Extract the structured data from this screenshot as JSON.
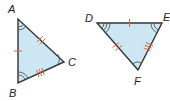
{
  "figure": {
    "colors": {
      "fill": "#cce7f3",
      "edge": "#333333",
      "tick": "#e0603a",
      "arc": "#555555"
    },
    "triangles": [
      {
        "name": "triangle-abc",
        "vertices": [
          {
            "label": "A",
            "x": 18,
            "y": 19
          },
          {
            "label": "B",
            "x": 18,
            "y": 83
          },
          {
            "label": "C",
            "x": 64,
            "y": 62
          }
        ],
        "side_marks": {
          "AB": 1,
          "AC": 2,
          "BC": 3
        },
        "angle_arcs": {
          "A": 2,
          "B": 2,
          "C": 1
        }
      },
      {
        "name": "triangle-def",
        "vertices": [
          {
            "label": "D",
            "x": 97,
            "y": 23
          },
          {
            "label": "E",
            "x": 162,
            "y": 23
          },
          {
            "label": "F",
            "x": 138,
            "y": 70
          }
        ],
        "side_marks": {
          "DE": 1,
          "DF": 2,
          "EF": 3
        },
        "angle_arcs": {
          "D": 3,
          "E": 2,
          "F": 1
        }
      }
    ],
    "labels": {
      "A": "A",
      "B": "B",
      "C": "C",
      "D": "D",
      "E": "E",
      "F": "F"
    }
  }
}
